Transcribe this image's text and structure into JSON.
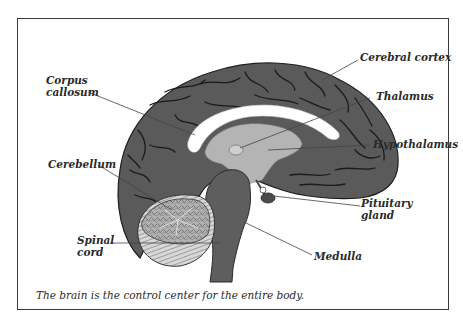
{
  "diagram": {
    "type": "labeled anatomical illustration",
    "labels": [
      {
        "id": "cerebral-cortex",
        "text": "Cerebral cortex"
      },
      {
        "id": "corpus-callosum",
        "line1": "Corpus",
        "line2": "callosum"
      },
      {
        "id": "thalamus",
        "text": "Thalamus"
      },
      {
        "id": "hypothalamus",
        "text": "Hypothalamus"
      },
      {
        "id": "cerebellum",
        "text": "Cerebellum"
      },
      {
        "id": "pituitary-gland",
        "line1": "Pituitary",
        "line2": "gland"
      },
      {
        "id": "spinal-cord",
        "line1": "Spinal",
        "line2": "cord"
      },
      {
        "id": "medulla",
        "text": "Medulla"
      }
    ],
    "caption": "The brain is the control center for the entire body.",
    "colors": {
      "cortex": "#5a5a5a",
      "sulci": "#1e1e1e",
      "white_matter": "#ffffff",
      "thalamus_region": "#b4b4b4",
      "cerebellum": "#a8a8a8",
      "brainstem": "#5e5e5e",
      "leader_lines": "#444444",
      "frame": "#3a3a3a"
    }
  }
}
